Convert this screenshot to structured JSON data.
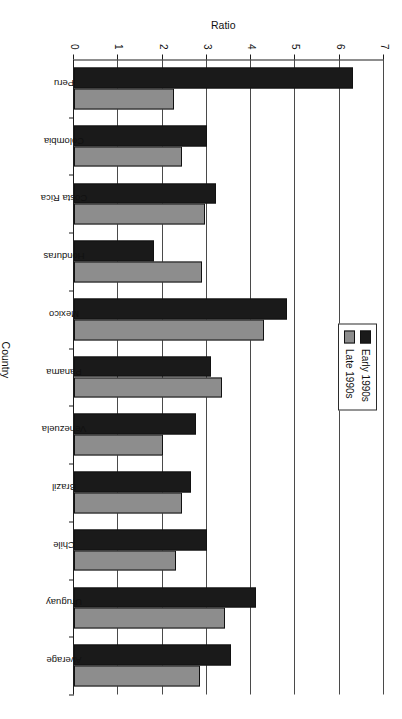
{
  "chart_data": {
    "type": "bar",
    "orientation": "vertical",
    "title": "",
    "xlabel": "Country",
    "ylabel": "Ratio",
    "ylim": [
      0,
      7
    ],
    "yticks": [
      "0",
      "1",
      "2",
      "3",
      "4",
      "5",
      "6",
      "7"
    ],
    "grid": true,
    "legend_position": "upper-right",
    "categories": [
      "Peru",
      "Colombia",
      "Costa Rica",
      "Honduras",
      "Mexico",
      "Panama",
      "Venezuela",
      "Brazil",
      "Chile",
      "Uruguay",
      "Average"
    ],
    "series": [
      {
        "name": "Early 1990s",
        "color": "#1a1a1a",
        "values": [
          6.3,
          3.0,
          3.2,
          1.8,
          4.8,
          3.1,
          2.75,
          2.65,
          3.0,
          4.1,
          3.55
        ]
      },
      {
        "name": "Late 1990s",
        "color": "#8d8d8d",
        "values": [
          2.25,
          2.45,
          2.95,
          2.9,
          4.3,
          3.35,
          2.0,
          2.45,
          2.3,
          3.4,
          2.85
        ]
      }
    ]
  },
  "legend": {
    "entries": [
      {
        "label": "Early 1990s",
        "swatch": "black-swatch"
      },
      {
        "label": "Late 1990s",
        "swatch": "gray-swatch"
      }
    ]
  },
  "artifact": {
    "text": ""
  }
}
